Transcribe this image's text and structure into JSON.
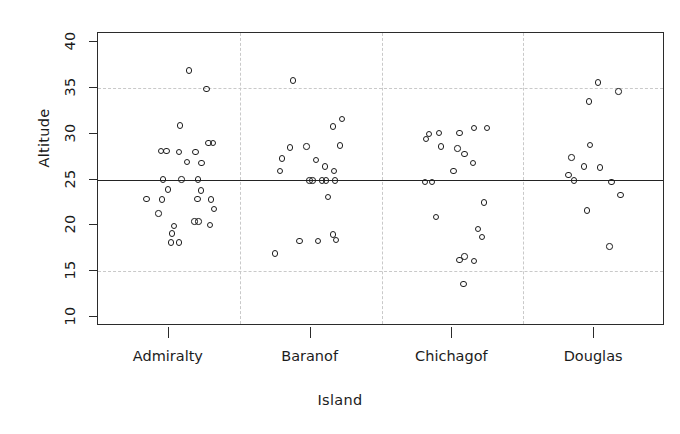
{
  "chart_data": {
    "type": "scatter",
    "title": "",
    "xlabel": "Island",
    "ylabel": "Altitude",
    "categories": [
      "Admiralty",
      "Baranof",
      "Chichagof",
      "Douglas"
    ],
    "ylim": [
      9,
      41
    ],
    "yticks": [
      10,
      15,
      20,
      25,
      30,
      35,
      40
    ],
    "ytick_labels": [
      "10",
      "15",
      "20",
      "25",
      "30",
      "35",
      "40"
    ],
    "grid": "horizontal dashed reference lines at y=35 and y=15; solid reference line at y=25; vertical dashed separators between island groups",
    "legend": "none",
    "reference_lines": {
      "solid": [
        25
      ],
      "dashed": [
        35,
        15
      ]
    },
    "group_separators_between": [
      "Admiralty|Baranof",
      "Baranof|Chichagof",
      "Chichagof|Douglas"
    ],
    "series": [
      {
        "name": "Admiralty",
        "points": [
          {
            "jitter": 0.4,
            "y": 36.9
          },
          {
            "jitter": 0.74,
            "y": 34.9
          },
          {
            "jitter": 0.22,
            "y": 30.9
          },
          {
            "jitter": -0.16,
            "y": 28.1
          },
          {
            "jitter": -0.05,
            "y": 28.1
          },
          {
            "jitter": 0.2,
            "y": 28.0
          },
          {
            "jitter": 0.52,
            "y": 28.0
          },
          {
            "jitter": 0.78,
            "y": 29.0
          },
          {
            "jitter": 0.36,
            "y": 26.9
          },
          {
            "jitter": 0.64,
            "y": 26.8
          },
          {
            "jitter": -0.12,
            "y": 25.0
          },
          {
            "jitter": 0.25,
            "y": 25.0
          },
          {
            "jitter": 0.57,
            "y": 25.0
          },
          {
            "jitter": 0.86,
            "y": 29.0
          },
          {
            "jitter": -0.02,
            "y": 23.9
          },
          {
            "jitter": -0.44,
            "y": 22.9
          },
          {
            "jitter": -0.14,
            "y": 22.8
          },
          {
            "jitter": 0.63,
            "y": 23.8
          },
          {
            "jitter": 0.56,
            "y": 22.9
          },
          {
            "jitter": 0.82,
            "y": 22.8
          },
          {
            "jitter": 0.88,
            "y": 21.8
          },
          {
            "jitter": -0.2,
            "y": 21.3
          },
          {
            "jitter": 0.5,
            "y": 20.4
          },
          {
            "jitter": 0.58,
            "y": 20.4
          },
          {
            "jitter": 0.8,
            "y": 20.0
          },
          {
            "jitter": 0.1,
            "y": 19.9
          },
          {
            "jitter": 0.06,
            "y": 19.1
          },
          {
            "jitter": 0.04,
            "y": 18.1
          },
          {
            "jitter": 0.2,
            "y": 18.1
          }
        ]
      },
      {
        "name": "Baranof",
        "points": [
          {
            "jitter": -0.34,
            "y": 35.8
          },
          {
            "jitter": 0.44,
            "y": 30.8
          },
          {
            "jitter": -0.4,
            "y": 28.5
          },
          {
            "jitter": -0.08,
            "y": 28.6
          },
          {
            "jitter": 0.58,
            "y": 28.7
          },
          {
            "jitter": -0.56,
            "y": 27.3
          },
          {
            "jitter": 0.1,
            "y": 27.1
          },
          {
            "jitter": 0.28,
            "y": 26.4
          },
          {
            "jitter": 0.62,
            "y": 31.6
          },
          {
            "jitter": 0.46,
            "y": 25.9
          },
          {
            "jitter": -0.6,
            "y": 25.9
          },
          {
            "jitter": -0.02,
            "y": 24.9
          },
          {
            "jitter": 0.04,
            "y": 24.9
          },
          {
            "jitter": 0.22,
            "y": 24.9
          },
          {
            "jitter": 0.3,
            "y": 24.9
          },
          {
            "jitter": 0.48,
            "y": 24.9
          },
          {
            "jitter": 0.34,
            "y": 23.1
          },
          {
            "jitter": 0.44,
            "y": 19.0
          },
          {
            "jitter": 0.5,
            "y": 18.4
          },
          {
            "jitter": -0.7,
            "y": 16.9
          },
          {
            "jitter": -0.22,
            "y": 18.3
          },
          {
            "jitter": 0.14,
            "y": 18.3
          }
        ]
      },
      {
        "name": "Chichagof",
        "points": [
          {
            "jitter": -0.46,
            "y": 30.0
          },
          {
            "jitter": -0.26,
            "y": 30.1
          },
          {
            "jitter": -0.52,
            "y": 29.4
          },
          {
            "jitter": -0.22,
            "y": 28.6
          },
          {
            "jitter": 0.14,
            "y": 30.1
          },
          {
            "jitter": 0.42,
            "y": 30.6
          },
          {
            "jitter": 0.68,
            "y": 30.6
          },
          {
            "jitter": 0.1,
            "y": 28.4
          },
          {
            "jitter": 0.24,
            "y": 27.8
          },
          {
            "jitter": 0.4,
            "y": 26.8
          },
          {
            "jitter": 0.02,
            "y": 25.9
          },
          {
            "jitter": -0.54,
            "y": 24.7
          },
          {
            "jitter": -0.4,
            "y": 24.7
          },
          {
            "jitter": 0.62,
            "y": 22.5
          },
          {
            "jitter": -0.32,
            "y": 20.9
          },
          {
            "jitter": 0.5,
            "y": 19.6
          },
          {
            "jitter": 0.58,
            "y": 18.7
          },
          {
            "jitter": 0.14,
            "y": 16.2
          },
          {
            "jitter": 0.24,
            "y": 16.6
          },
          {
            "jitter": 0.42,
            "y": 16.1
          },
          {
            "jitter": 0.22,
            "y": 13.6
          }
        ]
      },
      {
        "name": "Douglas",
        "points": [
          {
            "jitter": 0.08,
            "y": 35.6
          },
          {
            "jitter": 0.48,
            "y": 34.6
          },
          {
            "jitter": -0.1,
            "y": 33.5
          },
          {
            "jitter": -0.08,
            "y": 28.8
          },
          {
            "jitter": -0.44,
            "y": 27.4
          },
          {
            "jitter": -0.2,
            "y": 26.4
          },
          {
            "jitter": 0.12,
            "y": 26.3
          },
          {
            "jitter": -0.5,
            "y": 25.5
          },
          {
            "jitter": -0.4,
            "y": 24.9
          },
          {
            "jitter": 0.34,
            "y": 24.7
          },
          {
            "jitter": 0.52,
            "y": 23.3
          },
          {
            "jitter": -0.14,
            "y": 21.6
          },
          {
            "jitter": 0.3,
            "y": 17.7
          }
        ]
      }
    ]
  },
  "axes": {
    "y_title": "Altitude",
    "x_title": "Island"
  }
}
